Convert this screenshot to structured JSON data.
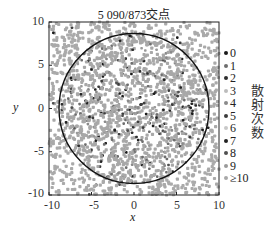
{
  "chart_data": {
    "type": "scatter",
    "title": "5 090/873交点",
    "xlabel": "x",
    "ylabel": "y",
    "xlim": [
      -10,
      10
    ],
    "ylim": [
      -10,
      10
    ],
    "xticks": [
      "-10",
      "-5",
      "0",
      "5",
      "10"
    ],
    "yticks": [
      "10",
      "5",
      "0",
      "-5",
      "-10"
    ],
    "grid": false,
    "total_points": 5090,
    "points_inside_circle": 873,
    "circle": {
      "center": [
        0,
        0
      ],
      "radius": 8.8,
      "color": "#111111"
    },
    "legend_title": "散射次数",
    "legend_position": "right",
    "legend": [
      {
        "label": "0",
        "color": "#1a1a1a"
      },
      {
        "label": "1",
        "color": "#6e6e6e"
      },
      {
        "label": "2",
        "color": "#2e2e2e"
      },
      {
        "label": "3",
        "color": "#bcbcbc"
      },
      {
        "label": "4",
        "color": "#8a8a8a"
      },
      {
        "label": "5",
        "color": "#3c3c3c"
      },
      {
        "label": "6",
        "color": "#c8c8c8"
      },
      {
        "label": "7",
        "color": "#222222"
      },
      {
        "label": "8",
        "color": "#505050"
      },
      {
        "label": "9",
        "color": "#9a9a9a"
      },
      {
        "label": "≥10",
        "color": "#a8a8a8"
      }
    ],
    "distribution_note": "Points fill the full [-10,10] square; density of darker (low scattering count) points concentrated near center inside circle, lighter gray (≥10) points dominate outside."
  }
}
